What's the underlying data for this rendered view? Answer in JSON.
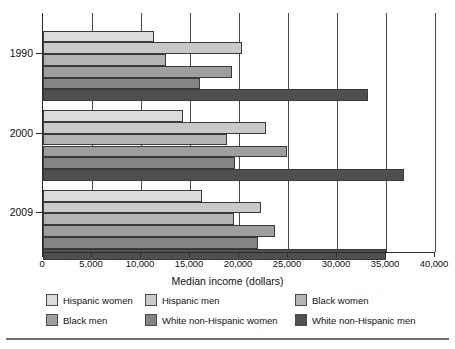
{
  "chart_data": {
    "type": "bar",
    "orientation": "horizontal",
    "title": "",
    "xlabel": "Median income (dollars)",
    "ylabel": "",
    "xlim": [
      0,
      40000
    ],
    "xticks": [
      0,
      5000,
      10000,
      15000,
      20000,
      25000,
      30000,
      35000,
      40000
    ],
    "xticklabels": [
      "0",
      "5,000",
      "10,000",
      "15,000",
      "20,000",
      "25,000",
      "30,000",
      "35,000",
      "40,000"
    ],
    "categories": [
      "1990",
      "2000",
      "2009"
    ],
    "grid": "vertical",
    "legend_position": "bottom",
    "series": [
      {
        "name": "Hispanic women",
        "color": "#dcdcdc",
        "values": [
          11300,
          14300,
          16200
        ]
      },
      {
        "name": "Hispanic men",
        "color": "#c9c9c9",
        "values": [
          20300,
          22800,
          22200
        ]
      },
      {
        "name": "Black women",
        "color": "#b4b4b4",
        "values": [
          12600,
          18800,
          19500
        ]
      },
      {
        "name": "Black men",
        "color": "#9e9e9e",
        "values": [
          19300,
          24900,
          23700
        ]
      },
      {
        "name": "White non-Hispanic women",
        "color": "#848484",
        "values": [
          16000,
          19600,
          21900
        ]
      },
      {
        "name": "White non-Hispanic men",
        "color": "#4f4f4f",
        "values": [
          33200,
          36800,
          35000
        ]
      }
    ]
  },
  "axis": {
    "x_title": "Median income (dollars)",
    "tick_labels": [
      "0",
      "5,000",
      "10,000",
      "15,000",
      "20,000",
      "25,000",
      "30,000",
      "35,000",
      "40,000"
    ],
    "group_labels": [
      "1990",
      "2000",
      "2009"
    ]
  },
  "legend": {
    "items": [
      {
        "label": "Hispanic women",
        "color": "#dcdcdc"
      },
      {
        "label": "Hispanic men",
        "color": "#c9c9c9"
      },
      {
        "label": "Black women",
        "color": "#b4b4b4"
      },
      {
        "label": "Black men",
        "color": "#9e9e9e"
      },
      {
        "label": "White non-Hispanic women",
        "color": "#848484"
      },
      {
        "label": "White non-Hispanic men",
        "color": "#4f4f4f"
      }
    ]
  }
}
